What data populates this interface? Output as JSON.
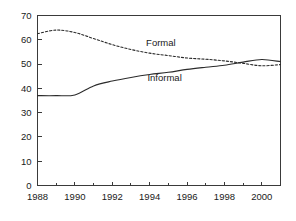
{
  "chart_data": {
    "type": "line",
    "title": "",
    "subtitle": "",
    "xlabel": "",
    "ylabel": "",
    "xlim": [
      1988,
      2001
    ],
    "ylim": [
      0,
      70
    ],
    "grid": false,
    "legend_position": "inline-annotation",
    "y_ticks": [
      0,
      10,
      20,
      30,
      40,
      50,
      60,
      70
    ],
    "y_tick_labels": [
      "0",
      "10",
      "20",
      "30",
      "40",
      "50",
      "60",
      "70"
    ],
    "x_ticks_major": [
      1988,
      1990,
      1992,
      1994,
      1996,
      1998,
      2000
    ],
    "x_tick_labels": [
      "1988",
      "1990",
      "1992",
      "1994",
      "1996",
      "1998",
      "2000"
    ],
    "x_ticks_minor": [
      1989,
      1991,
      1993,
      1995,
      1997,
      1999,
      2001
    ],
    "x": [
      1988,
      1989,
      1990,
      1991,
      1992,
      1993,
      1994,
      1995,
      1996,
      1997,
      1998,
      1999,
      2000,
      2001
    ],
    "series": [
      {
        "name": "Formal",
        "style": "dashed",
        "label_x": 1994.6,
        "label_y": 57.5,
        "values": [
          62.5,
          64.0,
          63.0,
          60.5,
          58.0,
          56.0,
          54.5,
          53.5,
          52.5,
          52.0,
          51.3,
          50.3,
          49.3,
          49.8
        ]
      },
      {
        "name": "Informal",
        "style": "solid",
        "label_x": 1994.8,
        "label_y": 43.0,
        "values": [
          37.0,
          37.0,
          37.3,
          41.0,
          43.0,
          44.5,
          45.7,
          46.6,
          47.8,
          48.7,
          49.5,
          50.8,
          51.9,
          51.0
        ]
      }
    ],
    "annotations": [
      {
        "text": "Formal",
        "x": 1994.6,
        "y": 57.5
      },
      {
        "text": "Informal",
        "x": 1994.8,
        "y": 43.0
      }
    ]
  }
}
